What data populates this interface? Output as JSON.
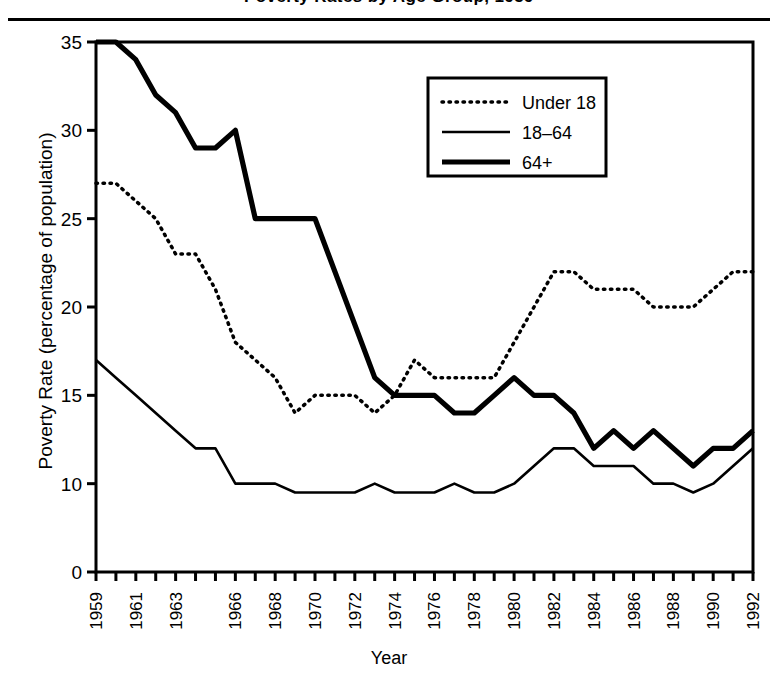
{
  "figure": {
    "title": "Poverty Rates by Age Group, 1959",
    "title_clipped": true
  },
  "axis_titles": {
    "y": "Poverty Rate (percentage of population)",
    "x": "Year"
  },
  "legend": {
    "entries": [
      {
        "label": "Under 18",
        "style": "dotted",
        "width": 3
      },
      {
        "label": "18–64",
        "style": "thin-solid",
        "width": 2
      },
      {
        "label": "64+",
        "style": "thick-solid",
        "width": 5
      }
    ]
  },
  "chart_data": {
    "type": "line",
    "title": "Poverty Rates by Age Group, 1959",
    "xlabel": "Year",
    "ylabel": "Poverty Rate (percentage of population)",
    "grid": false,
    "legend_position": "upper-right-inside",
    "ylim": [
      0,
      35
    ],
    "ytick_labels": [
      "0",
      "10",
      "15",
      "20",
      "25",
      "30",
      "35"
    ],
    "ytick_values": [
      0,
      10,
      15,
      20,
      25,
      30,
      35
    ],
    "y_axis_note": "Axis is broken below 10; the 0-to-10 span occupies the same height as each 5-unit step above it.",
    "xlim": [
      1959,
      1992
    ],
    "x": [
      1959,
      1960,
      1961,
      1962,
      1963,
      1964,
      1965,
      1966,
      1967,
      1968,
      1969,
      1970,
      1971,
      1972,
      1973,
      1974,
      1975,
      1976,
      1977,
      1978,
      1979,
      1980,
      1981,
      1982,
      1983,
      1984,
      1985,
      1986,
      1987,
      1988,
      1989,
      1990,
      1991,
      1992
    ],
    "xtick_labels": [
      "1959",
      "",
      "1961",
      "",
      "1963",
      "",
      "",
      "1966",
      "",
      "1968",
      "",
      "1970",
      "",
      "1972",
      "",
      "1974",
      "",
      "1976",
      "",
      "1978",
      "",
      "1980",
      "",
      "1982",
      "",
      "1984",
      "",
      "1986",
      "",
      "1988",
      "",
      "1990",
      "",
      "1992"
    ],
    "xtick_labels_rotation": 90,
    "series": [
      {
        "name": "Under 18",
        "style": "dotted",
        "values": [
          27,
          27,
          26,
          25,
          23,
          23,
          21,
          18,
          17,
          16,
          14,
          15,
          15,
          15,
          14,
          15,
          17,
          16,
          16,
          16,
          16,
          18,
          20,
          22,
          22,
          21,
          21,
          21,
          20,
          20,
          20,
          21,
          22,
          22
        ]
      },
      {
        "name": "18–64",
        "style": "thin-solid",
        "values": [
          17,
          16,
          15,
          14,
          13,
          12,
          12,
          10,
          10,
          10,
          9,
          9,
          9,
          9,
          10,
          9,
          9,
          9,
          10,
          9,
          9,
          10,
          11,
          12,
          12,
          11,
          11,
          11,
          10,
          10,
          9,
          10,
          11,
          12
        ]
      },
      {
        "name": "64+",
        "style": "thick-solid",
        "values": [
          35,
          35,
          34,
          32,
          31,
          29,
          29,
          30,
          25,
          25,
          25,
          25,
          22,
          19,
          16,
          15,
          15,
          15,
          14,
          14,
          15,
          16,
          15,
          15,
          14,
          12,
          13,
          12,
          13,
          12,
          11,
          12,
          12,
          13
        ]
      }
    ]
  }
}
